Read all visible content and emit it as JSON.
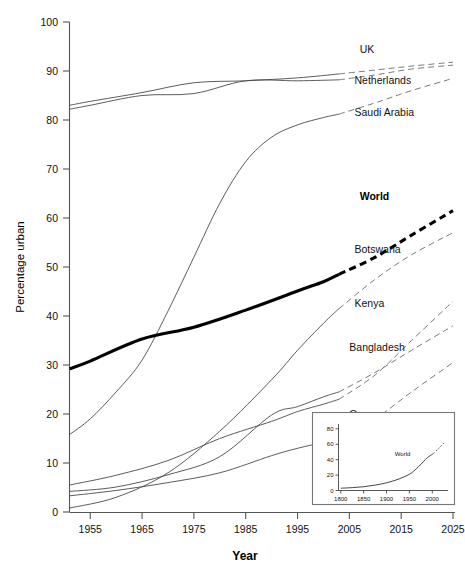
{
  "chart_data": {
    "type": "line",
    "title": "",
    "xlabel": "Year",
    "ylabel": "Percentage urban",
    "xlim": [
      1951,
      2025
    ],
    "ylim": [
      0,
      100
    ],
    "xticks": [
      1955,
      1965,
      1975,
      1985,
      1995,
      2005,
      2015,
      2025
    ],
    "yticks": [
      0,
      10,
      20,
      30,
      40,
      50,
      60,
      70,
      80,
      90,
      100
    ],
    "grid": false,
    "legend_position": "inline-right-labels",
    "projection_start_year": 2003,
    "note": "Solid segments are historical estimates; dashed segments are projections. The World series is drawn in heavy black.",
    "series": [
      {
        "name": "UK",
        "label": "UK",
        "emphasis": false,
        "label_x": 2007,
        "label_y": 94.5,
        "x": [
          1951,
          1955,
          1965,
          1975,
          1985,
          1995,
          2003,
          2010,
          2017,
          2025
        ],
        "y": [
          83.0,
          83.8,
          85.6,
          87.6,
          88.0,
          88.6,
          89.4,
          90.2,
          91.0,
          91.8
        ],
        "projected_from": 2003
      },
      {
        "name": "Netherlands",
        "label": "Netherlands",
        "emphasis": false,
        "label_x": 2006,
        "label_y": 88.0,
        "x": [
          1951,
          1955,
          1965,
          1975,
          1985,
          1995,
          2003,
          2010,
          2017,
          2025
        ],
        "y": [
          82.2,
          83.0,
          85.0,
          85.4,
          88.0,
          88.0,
          88.2,
          89.2,
          90.4,
          91.2
        ],
        "projected_from": 2003
      },
      {
        "name": "Saudi Arabia",
        "label": "Saudi Arabia",
        "emphasis": false,
        "label_x": 2006,
        "label_y": 81.5,
        "x": [
          1951,
          1955,
          1960,
          1965,
          1970,
          1975,
          1980,
          1985,
          1990,
          1995,
          2000,
          2003,
          2010,
          2017,
          2025
        ],
        "y": [
          15.8,
          19.0,
          24.5,
          31.0,
          41.0,
          52.0,
          63.0,
          71.5,
          76.5,
          79.0,
          80.5,
          81.2,
          83.5,
          86.0,
          88.5
        ],
        "projected_from": 2003
      },
      {
        "name": "World",
        "label": "World",
        "emphasis": true,
        "label_x": 2007,
        "label_y": 64.5,
        "x": [
          1951,
          1955,
          1965,
          1975,
          1985,
          1995,
          2000,
          2003,
          2010,
          2017,
          2025
        ],
        "y": [
          29.2,
          30.8,
          35.3,
          37.7,
          41.2,
          45.1,
          47.0,
          48.5,
          52.0,
          56.5,
          61.5
        ],
        "projected_from": 2003
      },
      {
        "name": "Botswana",
        "label": "Botswana",
        "emphasis": false,
        "label_x": 2006,
        "label_y": 53.5,
        "x": [
          1951,
          1960,
          1970,
          1980,
          1990,
          1995,
          2000,
          2003,
          2010,
          2017,
          2025
        ],
        "y": [
          0.8,
          3.0,
          8.0,
          16.5,
          27.0,
          33.0,
          38.5,
          41.5,
          47.5,
          52.5,
          57.0
        ],
        "projected_from": 2003
      },
      {
        "name": "Kenya",
        "label": "Kenya",
        "emphasis": false,
        "label_x": 2006,
        "label_y": 42.5,
        "x": [
          1951,
          1960,
          1970,
          1980,
          1990,
          1995,
          2000,
          2003,
          2010,
          2017,
          2025
        ],
        "y": [
          5.5,
          7.5,
          10.5,
          15.0,
          18.5,
          20.5,
          22.0,
          23.0,
          28.0,
          35.0,
          43.0
        ],
        "projected_from": 2003
      },
      {
        "name": "Bangladesh",
        "label": "Bangladesh",
        "emphasis": false,
        "label_x": 2005,
        "label_y": 33.5,
        "x": [
          1951,
          1960,
          1970,
          1980,
          1990,
          1995,
          2000,
          2003,
          2010,
          2017,
          2025
        ],
        "y": [
          4.2,
          5.1,
          7.6,
          11.3,
          19.8,
          21.5,
          23.5,
          24.5,
          28.5,
          33.0,
          38.0
        ],
        "projected_from": 2003
      },
      {
        "name": "Oman",
        "label": "Oman",
        "emphasis": false,
        "label_x": 2005,
        "label_y": 20.0,
        "x": [
          1951,
          1960,
          1970,
          1980,
          1990,
          1995,
          2000,
          2003,
          2010,
          2017,
          2025
        ],
        "y": [
          3.3,
          4.4,
          6.0,
          8.0,
          11.5,
          13.0,
          14.2,
          14.8,
          19.0,
          24.5,
          30.5
        ],
        "projected_from": 2003
      }
    ]
  },
  "inset": {
    "type": "line",
    "xlabel": "",
    "ylabel": "",
    "xlim": [
      1795,
      2030
    ],
    "ylim": [
      0,
      85
    ],
    "xticks": [
      1800,
      1850,
      1900,
      1950,
      2000
    ],
    "yticks": [
      0,
      20,
      40,
      60,
      80
    ],
    "series_label": "World",
    "series_label_x": 1935,
    "series_label_y": 45,
    "projection_start_year": 2003,
    "x": [
      1800,
      1825,
      1850,
      1875,
      1900,
      1925,
      1950,
      1960,
      1970,
      1980,
      1990,
      2000,
      2003,
      2015,
      2025
    ],
    "y": [
      3.0,
      3.7,
      4.9,
      7.0,
      10.0,
      14.5,
      21.0,
      25.5,
      31.0,
      37.0,
      43.0,
      47.0,
      48.5,
      55.0,
      61.5
    ]
  },
  "colors": {
    "background": "#ffffff",
    "axis": "#555555",
    "series_line": "#4a4a4a",
    "projection_line": "#6b6b6b",
    "world_line": "#000000",
    "text": "#111111"
  }
}
